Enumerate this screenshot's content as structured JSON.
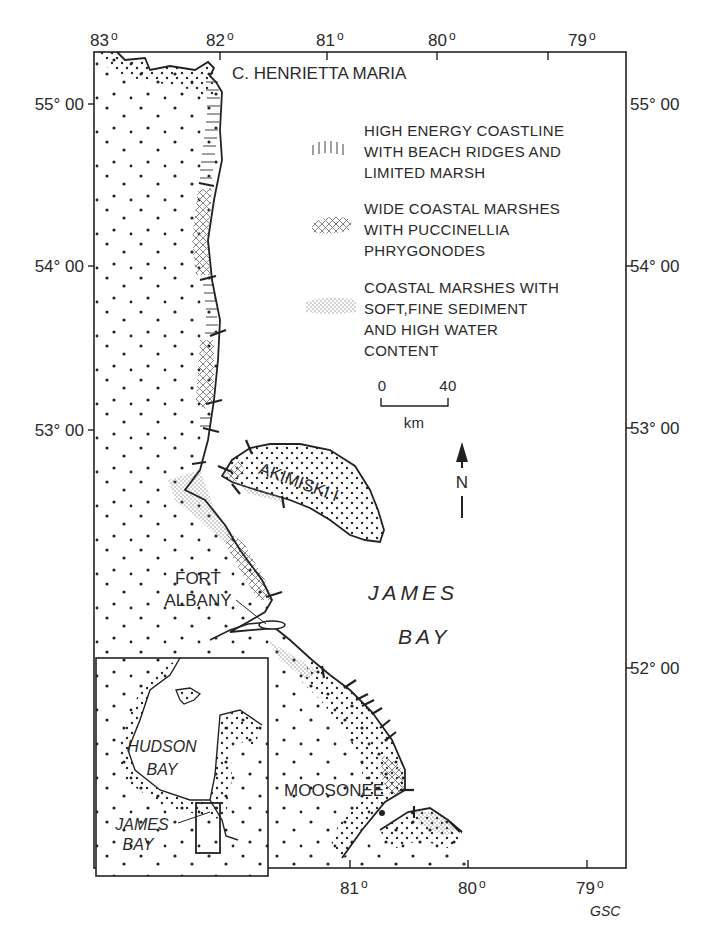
{
  "map": {
    "longitude_ticks": [
      {
        "label": "83",
        "deg": "o"
      },
      {
        "label": "82",
        "deg": "o"
      },
      {
        "label": "81",
        "deg": "o"
      },
      {
        "label": "80",
        "deg": "o"
      },
      {
        "label": "79",
        "deg": "o"
      }
    ],
    "latitude_ticks_left": [
      {
        "label": "55° 00"
      },
      {
        "label": "54° 00"
      },
      {
        "label": "53° 00"
      }
    ],
    "latitude_ticks_right": [
      {
        "label": "55° 00"
      },
      {
        "label": "54° 00"
      },
      {
        "label": "53° 00"
      },
      {
        "label": "52° 00"
      }
    ],
    "places": {
      "cape": "C. HENRIETTA MARIA",
      "island": "AKIMISKI I",
      "fort_line1": "FORT",
      "fort_line2": "ALBANY",
      "moosonee": "MOOSONEE"
    },
    "water": {
      "line1": "JAMES",
      "line2": "BAY"
    },
    "legend": [
      {
        "symbol": "hatched-coast",
        "lines": [
          "HIGH ENERGY COASTLINE",
          "WITH BEACH RIDGES AND",
          "LIMITED MARSH"
        ]
      },
      {
        "symbol": "crosshatched-coast",
        "lines": [
          "WIDE COASTAL MARSHES",
          "WITH PUCCINELLIA",
          "PHRYGONODES"
        ]
      },
      {
        "symbol": "stippled-coast",
        "lines": [
          "COASTAL MARSHES WITH",
          "SOFT,FINE SEDIMENT",
          "AND HIGH WATER",
          "CONTENT"
        ]
      }
    ],
    "scale": {
      "start": "0",
      "end": "40",
      "unit": "km"
    },
    "north_arrow": {
      "label": "N"
    },
    "inset": {
      "label_hudson_1": "HUDSON",
      "label_hudson_2": "BAY",
      "label_james_1": "JAMES",
      "label_james_2": "BAY"
    },
    "credit": "GSC"
  }
}
